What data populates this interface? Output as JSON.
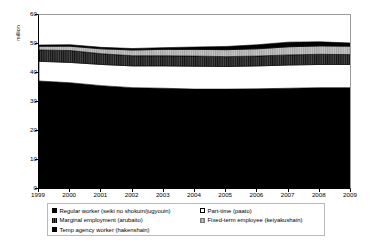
{
  "chart_data": {
    "type": "area",
    "title": "",
    "xlabel": "",
    "ylabel": "million",
    "ylim": [
      0,
      60
    ],
    "yticks": [
      0,
      10,
      20,
      30,
      40,
      50,
      60
    ],
    "grid": false,
    "legend_position": "bottom",
    "stacked": true,
    "x": [
      1999,
      2000,
      2001,
      2002,
      2003,
      2004,
      2005,
      2006,
      2007,
      2008,
      2009
    ],
    "categories": [
      "1999",
      "2000",
      "2001",
      "2002",
      "2003",
      "2004",
      "2005",
      "2006",
      "2007",
      "2008",
      "2009"
    ],
    "series": [
      {
        "name": "Regular worker (seiki no shokuin/jugyouin)",
        "color": "#000000",
        "pattern": "solid",
        "values": [
          36.9,
          36.3,
          35.3,
          34.6,
          34.4,
          34.1,
          34.1,
          34.2,
          34.4,
          34.6,
          34.6
        ]
      },
      {
        "name": "Part-time (paato)",
        "color": "#ffffff",
        "pattern": "solid",
        "values": [
          6.8,
          7.0,
          7.3,
          7.5,
          7.7,
          7.9,
          7.8,
          7.9,
          8.0,
          8.0,
          8.0
        ]
      },
      {
        "name": "Marginal employment (arubaito)",
        "color": "#2b2b2b",
        "pattern": "vertical-hatch-dark",
        "values": [
          3.9,
          4.1,
          3.7,
          3.5,
          3.5,
          3.5,
          3.4,
          3.4,
          3.5,
          3.5,
          3.4
        ]
      },
      {
        "name": "Fixed-term employee (keiyakushain)",
        "color": "#b3b3b3",
        "pattern": "vertical-hatch-light",
        "values": [
          1.3,
          1.5,
          1.7,
          2.0,
          2.2,
          2.3,
          2.4,
          2.5,
          2.8,
          2.9,
          2.9
        ]
      },
      {
        "name": "Temp agency worker (hakenshain)",
        "color": "#000000",
        "pattern": "solid",
        "values": [
          0.4,
          0.5,
          0.5,
          0.5,
          0.6,
          0.8,
          1.1,
          1.4,
          1.6,
          1.4,
          1.1
        ]
      }
    ],
    "totals": [
      49.3,
      49.4,
      48.5,
      48.1,
      48.4,
      48.6,
      48.8,
      49.4,
      50.3,
      50.4,
      50.0
    ]
  },
  "axes": {
    "y": {
      "label": "million",
      "ticks": [
        "60",
        "50",
        "40",
        "30",
        "20",
        "10",
        "0"
      ]
    },
    "x": {
      "ticks": [
        "1999",
        "2000",
        "2001",
        "2002",
        "2003",
        "2004",
        "2005",
        "2006",
        "2007",
        "2008",
        "2009"
      ]
    }
  },
  "legend": {
    "left_column": [
      {
        "label": "Regular worker (seiki no shokuin/jugyouin)",
        "swatch": "regular"
      },
      {
        "label": "Marginal employment (arubaito)",
        "swatch": "marginal"
      },
      {
        "label": "Temp agency worker (hakenshain)",
        "swatch": "temp"
      }
    ],
    "right_column": [
      {
        "label": "Part-time (paato)",
        "swatch": "parttime"
      },
      {
        "label": "Fixed-term employee (keiyakushain)",
        "swatch": "fixed"
      }
    ]
  }
}
